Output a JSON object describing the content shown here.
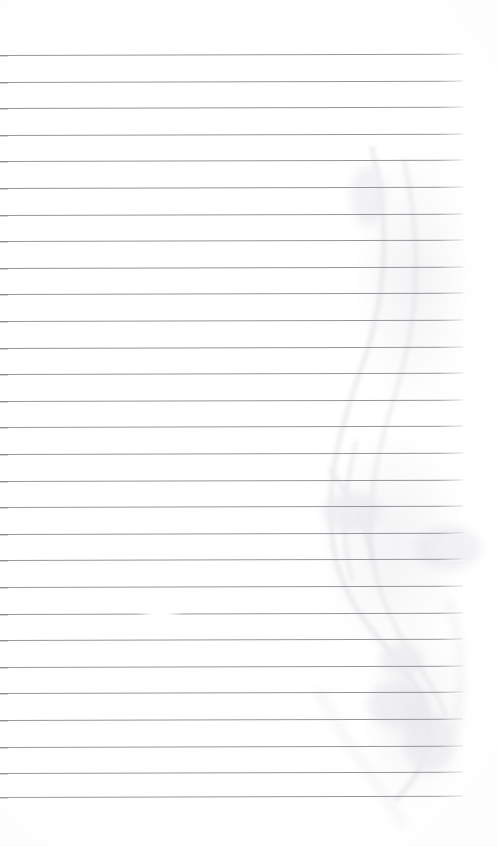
{
  "document": {
    "kind": "scanned-lined-notebook-page",
    "title": "Blank lined notebook page",
    "description": "A scanned blank ruled notebook sheet with no handwriting or printed text.",
    "page_width": 497,
    "page_height": 847,
    "background_color": "#ffffff",
    "text_content": "",
    "visible_text_blocks": []
  },
  "ruling": {
    "line_color": "#8e8e94",
    "line_thickness_px": 1,
    "line_count": 29,
    "first_line_y": 55,
    "line_spacing_px": 26.6,
    "line_start_x": 0,
    "line_end_x": 463,
    "tilt_degrees": -0.16,
    "lines_y": [
      55,
      81.6,
      108.2,
      134.8,
      161.4,
      188,
      214.6,
      241.2,
      267.8,
      294.4,
      321,
      347.6,
      374.2,
      400.8,
      427.4,
      454,
      480.6,
      507.2,
      533.8,
      560.4,
      587,
      613.6,
      640.2,
      666.8,
      693.4,
      720,
      746.6,
      773.2,
      797
    ]
  },
  "artifacts": {
    "bleed_through_color": "#dcdce2",
    "description": "Faint curved bleed-through strokes from writing on the reverse side, visible in the right half of the page.",
    "dropout": {
      "description": "Small scan dropout / lighter break in one ruled line in the lower middle of the page.",
      "line_index": 21,
      "x": 136,
      "width": 48
    },
    "smudges": [
      {
        "name": "upper-right-ghost",
        "x": 352,
        "y": 150,
        "w": 120,
        "h": 260
      },
      {
        "name": "mid-right-ghost",
        "x": 318,
        "y": 430,
        "w": 150,
        "h": 230
      },
      {
        "name": "lower-right-ghost",
        "x": 360,
        "y": 620,
        "w": 110,
        "h": 190
      }
    ]
  }
}
